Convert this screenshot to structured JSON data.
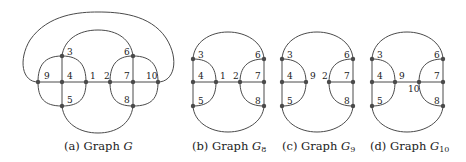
{
  "figure": {
    "panels": [
      {
        "id": "a",
        "caption_prefix": "(a) Graph ",
        "caption_symbol": "G",
        "caption_sub": "",
        "node_labels": [
          "1",
          "2",
          "3",
          "4",
          "5",
          "6",
          "7",
          "8",
          "9",
          "10"
        ]
      },
      {
        "id": "b",
        "caption_prefix": "(b) Graph ",
        "caption_symbol": "G",
        "caption_sub": "8",
        "node_labels": [
          "1",
          "2",
          "3",
          "4",
          "5",
          "6",
          "7",
          "8"
        ]
      },
      {
        "id": "c",
        "caption_prefix": "(c) Graph ",
        "caption_symbol": "G",
        "caption_sub": "9",
        "node_labels": [
          "2",
          "3",
          "4",
          "5",
          "6",
          "7",
          "8",
          "9"
        ]
      },
      {
        "id": "d",
        "caption_prefix": "(d) Graph ",
        "caption_symbol": "G",
        "caption_sub": "10",
        "node_labels": [
          "3",
          "4",
          "5",
          "6",
          "7",
          "8",
          "9",
          "10"
        ]
      }
    ],
    "labels": {
      "a": {
        "n1": "1",
        "n2": "2",
        "n3": "3",
        "n4": "4",
        "n5": "5",
        "n6": "6",
        "n7": "7",
        "n8": "8",
        "n9": "9",
        "n10": "10"
      },
      "b": {
        "n1": "1",
        "n2": "2",
        "n3": "3",
        "n4": "4",
        "n5": "5",
        "n6": "6",
        "n7": "7",
        "n8": "8"
      },
      "c": {
        "n2": "2",
        "n3": "3",
        "n4": "4",
        "n5": "5",
        "n6": "6",
        "n7": "7",
        "n8": "8",
        "n9": "9"
      },
      "d": {
        "n3": "3",
        "n4": "4",
        "n5": "5",
        "n6": "6",
        "n7": "7",
        "n8": "8",
        "n9": "9",
        "n10": "10"
      }
    },
    "colors": {
      "edge": "#4a4a4a",
      "node": "#4a4a4a",
      "text": "#222222",
      "background": "#ffffff"
    }
  }
}
